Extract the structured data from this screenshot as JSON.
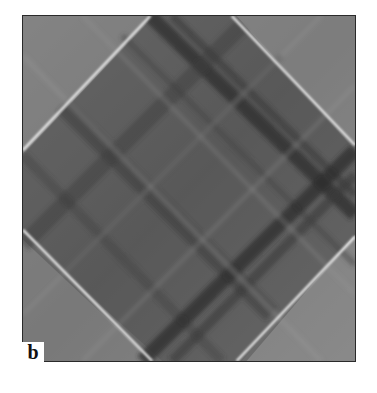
{
  "figure": {
    "panel_label": "b",
    "colors": {
      "background": "#6e6e6e",
      "dark_band": "#2e2e2e",
      "bright_line": "#e8e8e8",
      "light_corner": "#9a9a9a",
      "frame": "#2a2a2a"
    }
  }
}
